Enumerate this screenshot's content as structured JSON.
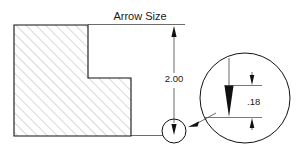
{
  "drawing": {
    "title": "Arrow Size",
    "background_color": "#ffffff",
    "line_color": "#111111",
    "hatch_color": "#6d6d6d",
    "text_color": "#1a1a1a",
    "dimensions": [
      {
        "id": "overall-height",
        "label": "2.00",
        "orientation": "vertical",
        "description": "Overall height of stepped part"
      },
      {
        "id": "arrow-length",
        "label": ".18",
        "orientation": "vertical",
        "description": "Arrowhead length shown in magnified detail"
      }
    ],
    "detail_view": {
      "name": "arrowhead-detail",
      "shape": "circle",
      "description": "Magnified circular detail of dimension arrowhead"
    },
    "part": {
      "name": "stepped-block-section",
      "hatch_pattern": "45-degree section hatch",
      "profile": "L-shaped stepped cross section"
    }
  }
}
